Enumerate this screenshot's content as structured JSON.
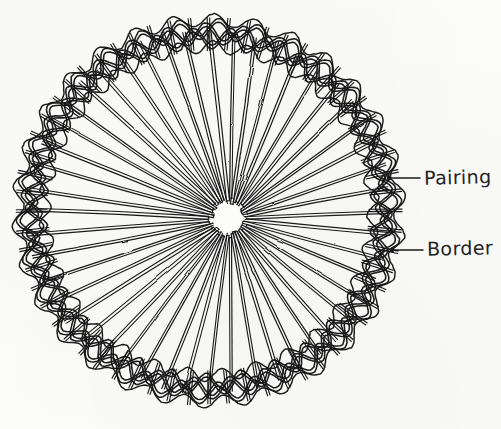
{
  "figure": {
    "medium": "pen and ink line drawing on off-white paper",
    "background_color": "#fcfcfb",
    "ink_color": "#1a1a1a"
  },
  "labels": [
    {
      "id": "pairing",
      "text": "Pairing",
      "leader_from_x": 420,
      "leader_from_y": 178,
      "leader_to_x": 389,
      "leader_to_y": 178
    },
    {
      "id": "border",
      "text": "Border",
      "leader_from_x": 423,
      "leader_from_y": 250,
      "leader_to_x": 392,
      "leader_to_y": 250
    }
  ],
  "geometry": {
    "center_x": 209,
    "center_y": 211,
    "outer_radius": 192,
    "border_band_outer": 192,
    "border_band_inner": 163,
    "hub_radius": 17,
    "hub_center_x": 228,
    "hub_center_y": 218,
    "spoke_count": 48,
    "spoke_pair_gap": 2.6,
    "braid_strand_count": 3,
    "braid_repeat_count": 30
  }
}
